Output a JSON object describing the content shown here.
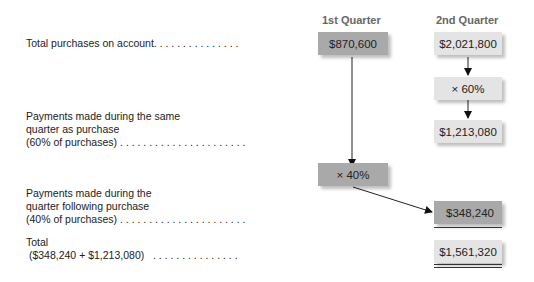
{
  "headers": {
    "q1": "1st Quarter",
    "q2": "2nd Quarter"
  },
  "rows": [
    {
      "label": "Total purchases on account. . . . . . . . . . . . . . ."
    },
    {
      "label": "Payments made during the same\nquarter as purchase\n(60% of purchases) . . . . . . . . . . . . . . . . . . . . . ."
    },
    {
      "label": "Payments made during the\nquarter following purchase\n(40% of purchases) . . . . . . . . . . . . . . . . . . . . . ."
    },
    {
      "label": "Total\n ($348,240 + $1,213,080)   . . . . . . . . . . . . . . ."
    }
  ],
  "boxes": {
    "q1_purchases": "$870,600",
    "q2_purchases": "$2,021,800",
    "q2_rate": "× 60%",
    "q2_same_quarter": "$1,213,080",
    "q1_rate": "× 40%",
    "q2_following": "$348,240",
    "q2_total": "$1,561,320"
  }
}
